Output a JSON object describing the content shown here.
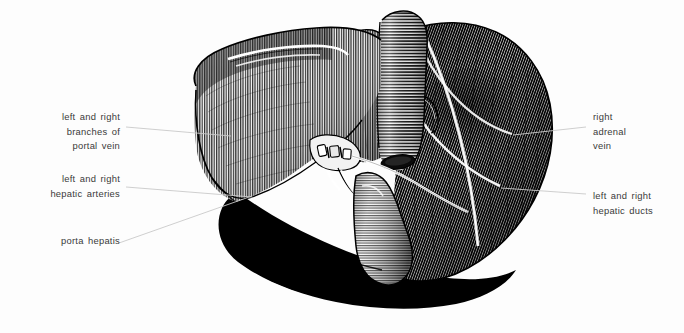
{
  "figure": {
    "background_color": "#fdfdfd",
    "ink_color": "#111111",
    "label_color": "#3a3a3a",
    "leader_color": "#c9c9c9",
    "style": "pen-and-ink engraved line hatching",
    "width": 684,
    "height": 333
  },
  "labels": {
    "portal_vein": {
      "lines": [
        "left and right",
        "branches of",
        "portal vein"
      ],
      "align": "right",
      "x": 36,
      "y": 110,
      "width": 84
    },
    "hepatic_arteries": {
      "lines": [
        "left and right",
        "hepatic arteries"
      ],
      "align": "right",
      "x": 33,
      "y": 172,
      "width": 87
    },
    "porta_hepatis": {
      "lines": [
        "porta hepatis"
      ],
      "align": "right",
      "x": 42,
      "y": 234,
      "width": 78
    },
    "adrenal_vein": {
      "lines": [
        "right",
        "adrenal",
        "vein"
      ],
      "align": "left",
      "x": 593,
      "y": 110,
      "width": 90
    },
    "hepatic_ducts": {
      "lines": [
        "left and right",
        "hepatic ducts"
      ],
      "align": "left",
      "x": 593,
      "y": 189,
      "width": 90
    }
  },
  "leaders": [
    {
      "name": "leader-portal-vein",
      "x1": 126,
      "y1": 127,
      "x2": 231,
      "y2": 136
    },
    {
      "name": "leader-hepatic-arteries",
      "x1": 126,
      "y1": 187,
      "x2": 252,
      "y2": 197
    },
    {
      "name": "leader-porta-hepatis",
      "x1": 119,
      "y1": 243,
      "x2": 252,
      "y2": 196
    },
    {
      "name": "leader-adrenal-vein",
      "x1": 586,
      "y1": 127,
      "x2": 513,
      "y2": 135
    },
    {
      "name": "leader-hepatic-ducts",
      "x1": 586,
      "y1": 194,
      "x2": 501,
      "y2": 188
    }
  ],
  "anatomy": {
    "structures": [
      {
        "name": "left-lobe",
        "tone": "mid-gray vertical hatch"
      },
      {
        "name": "right-lobe",
        "tone": "dark dense hatch"
      },
      {
        "name": "caudate-lobe",
        "tone": "mid-gray hatch"
      },
      {
        "name": "inferior-vena-cava",
        "tone": "ribbed tube, horizontal bands"
      },
      {
        "name": "gallbladder",
        "tone": "banded pear shape"
      },
      {
        "name": "porta-hepatis",
        "tone": "vessel cluster, light"
      },
      {
        "name": "ligamentum-venosum",
        "tone": "white fissure line"
      },
      {
        "name": "cast-shadow",
        "tone": "solid black"
      }
    ]
  }
}
